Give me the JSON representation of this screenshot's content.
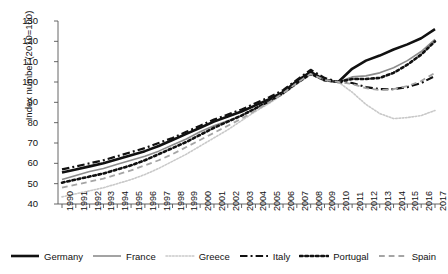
{
  "chart_data": {
    "type": "line",
    "title": "",
    "xlabel": "",
    "ylabel": "Index number (2010=100)",
    "ylim": [
      40,
      130
    ],
    "yticks": [
      40,
      50,
      60,
      70,
      80,
      90,
      100,
      110,
      120,
      130
    ],
    "grid": false,
    "legend_position": "bottom",
    "x": [
      1990,
      1991,
      1992,
      1993,
      1994,
      1995,
      1996,
      1997,
      1998,
      1999,
      2000,
      2001,
      2002,
      2003,
      2004,
      2005,
      2006,
      2007,
      2008,
      2009,
      2010,
      2011,
      2012,
      2013,
      2014,
      2015,
      2016,
      2017
    ],
    "categories": [
      "1990",
      "1991",
      "1992",
      "1993",
      "1994",
      "1995",
      "1996",
      "1997",
      "1998",
      "1999",
      "2000",
      "2001",
      "2002",
      "2003",
      "2004",
      "2005",
      "2006",
      "2007",
      "2008",
      "2009",
      "2010",
      "2011",
      "2012",
      "2013",
      "2014",
      "2015",
      "2016",
      "2017"
    ],
    "series": [
      {
        "name": "Germany",
        "color": "#111111",
        "style": "solid",
        "width": 2.6,
        "values": [
          55.5,
          57.0,
          58.5,
          60.0,
          62.0,
          64.0,
          66.0,
          68.5,
          71.5,
          74.5,
          77.5,
          80.5,
          83.0,
          85.5,
          88.5,
          91.5,
          95.0,
          100.5,
          105.0,
          101.0,
          100.0,
          106.5,
          110.5,
          113.0,
          116.0,
          118.5,
          121.5,
          126.0
        ]
      },
      {
        "name": "France",
        "color": "#8c8c8c",
        "style": "solid",
        "width": 1.6,
        "values": [
          52.0,
          54.0,
          56.0,
          57.5,
          59.5,
          61.5,
          63.5,
          66.0,
          69.0,
          72.0,
          75.5,
          78.5,
          81.0,
          83.5,
          87.0,
          90.5,
          94.5,
          99.5,
          104.0,
          100.5,
          100.0,
          102.5,
          103.0,
          104.5,
          107.0,
          110.5,
          115.0,
          121.0
        ]
      },
      {
        "name": "Greece",
        "color": "#c9c9c9",
        "style": "dotted",
        "width": 1.6,
        "values": [
          43.5,
          45.0,
          46.5,
          48.0,
          50.0,
          52.0,
          54.5,
          57.5,
          61.0,
          64.5,
          68.5,
          72.5,
          76.5,
          81.0,
          85.5,
          89.5,
          94.0,
          99.0,
          103.5,
          101.5,
          100.0,
          95.0,
          89.0,
          84.5,
          82.0,
          82.5,
          83.5,
          86.0
        ]
      },
      {
        "name": "Italy",
        "color": "#111111",
        "style": "dashdot",
        "width": 2.2,
        "values": [
          57.0,
          58.5,
          60.0,
          61.5,
          63.5,
          65.5,
          67.5,
          70.0,
          72.5,
          75.5,
          78.5,
          81.5,
          84.0,
          86.5,
          89.5,
          92.5,
          96.0,
          101.0,
          106.0,
          102.0,
          100.0,
          99.5,
          97.5,
          96.5,
          96.5,
          97.5,
          99.5,
          103.0
        ]
      },
      {
        "name": "Portugal",
        "color": "#111111",
        "style": "dotted",
        "width": 2.6,
        "values": [
          50.5,
          52.0,
          53.5,
          55.0,
          57.0,
          59.0,
          61.5,
          64.5,
          67.5,
          70.5,
          74.0,
          77.5,
          80.5,
          83.5,
          87.0,
          90.5,
          94.5,
          99.5,
          104.0,
          101.0,
          100.0,
          101.5,
          101.5,
          102.0,
          104.5,
          108.5,
          113.5,
          120.0
        ]
      },
      {
        "name": "Spain",
        "color": "#a5a5a5",
        "style": "dashed",
        "width": 1.8,
        "values": [
          48.0,
          49.5,
          51.0,
          52.5,
          54.5,
          56.5,
          59.0,
          61.5,
          64.5,
          68.0,
          71.5,
          75.0,
          78.5,
          82.0,
          86.0,
          90.0,
          94.5,
          99.5,
          104.0,
          101.0,
          100.0,
          99.0,
          97.0,
          96.0,
          96.5,
          98.0,
          100.5,
          104.5
        ]
      }
    ]
  },
  "legend": {
    "items": [
      {
        "label": "Germany"
      },
      {
        "label": "France"
      },
      {
        "label": "Greece"
      },
      {
        "label": "Italy"
      },
      {
        "label": "Portugal"
      },
      {
        "label": "Spain"
      }
    ]
  },
  "axes": {
    "y_axis_title": "Index number (2010=100)"
  }
}
